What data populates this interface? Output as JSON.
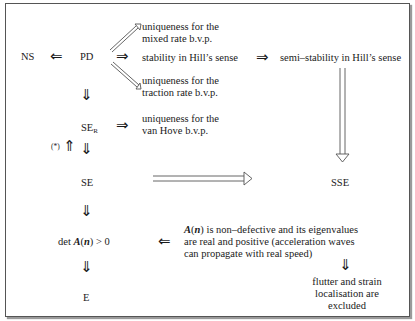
{
  "nodes": {
    "ns": "NS",
    "pd": "PD",
    "ser_main": "SE",
    "ser_sub": "R",
    "se": "SE",
    "det_prefix": "det ",
    "det_A": "A",
    "det_open": "(",
    "det_n": "n",
    "det_close": ") > 0",
    "e": "E",
    "sse": "SSE",
    "star": "(*)"
  },
  "labels": {
    "mixed_line1": "uniqueness for the",
    "mixed_line2": "mixed rate b.v.p.",
    "stability": "stability in Hill’s sense",
    "semi_stability": "semi–stability in Hill’s sense",
    "traction_line1": "uniqueness for the",
    "traction_line2": "traction rate b.v.p.",
    "vanhove_line1": "uniqueness for the",
    "vanhove_line2": "van Hove b.v.p.",
    "nondef_A": "A",
    "nondef_open": "(",
    "nondef_n": "n",
    "nondef_line1_rest": ") is non–defective and its eigenvalues",
    "nondef_line2": "are real and positive (acceleration waves",
    "nondef_line3": "can propagate with real speed)",
    "flutter_line1": "flutter and strain",
    "flutter_line2": "localisation are",
    "flutter_line3": "excluded"
  },
  "arrows": {
    "implies_left": "⇐",
    "implies_right": "⇒",
    "implies_down": "⇓",
    "implies_up": "⇑"
  }
}
